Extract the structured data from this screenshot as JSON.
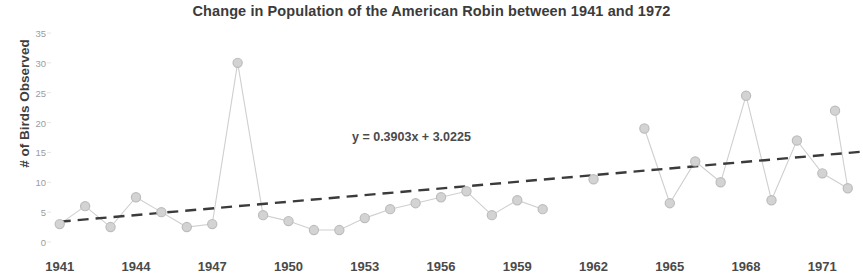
{
  "chart_data": {
    "type": "line",
    "title": "Change in Population of the American Robin between 1941 and 1972",
    "xlabel": "",
    "ylabel": "# of Birds Observed",
    "xlim": [
      1940.5,
      1972.6
    ],
    "ylim": [
      0,
      35
    ],
    "grid": false,
    "legend": false,
    "y_ticks": [
      0,
      5,
      10,
      15,
      20,
      25,
      30,
      35
    ],
    "x_ticks": [
      1941,
      1944,
      1947,
      1950,
      1953,
      1956,
      1959,
      1962,
      1965,
      1968,
      1971
    ],
    "x_tick_labels": [
      "1941",
      "1944",
      "1947",
      "1950",
      "1953",
      "1956",
      "1959",
      "1962",
      "1965",
      "1968",
      "1971"
    ],
    "y_tick_labels": [
      "0",
      "5",
      "10",
      "15",
      "20",
      "25",
      "30",
      "35"
    ],
    "annotations": [
      {
        "text": "y = 0.3903x + 3.0225",
        "x": 1954.2,
        "y": 17.2
      }
    ],
    "series": [
      {
        "name": "# of Birds Observed",
        "type": "line",
        "marker": "circle",
        "color": "#c9c9c9",
        "line_color": "#cfcfcf",
        "x": [
          1941,
          1942,
          1943,
          1944,
          1945,
          1946,
          1947,
          1948,
          1949,
          1950,
          1951,
          1952,
          1953,
          1954,
          1955,
          1956,
          1957,
          1958,
          1959,
          1960,
          1962,
          1964,
          1965,
          1966,
          1967,
          1968,
          1969,
          1970,
          1971,
          1972
        ],
        "values": [
          3,
          6,
          2.5,
          7.5,
          5,
          2.5,
          3,
          30,
          4.5,
          3.5,
          2,
          2,
          4,
          5.5,
          6.5,
          7.5,
          8.5,
          4.5,
          7,
          5.5,
          10.5,
          19,
          6.5,
          13.5,
          10,
          24.5,
          7,
          17,
          11.5,
          9
        ],
        "gaps": [
          [
            1960,
            1962
          ],
          [
            1962,
            1964
          ]
        ]
      },
      {
        "name": "Linear trendline",
        "type": "line",
        "style": "dashed",
        "color": "#3b3b3b",
        "equation": "y = 0.3903x + 3.0225",
        "slope": 0.3903,
        "intercept": 3.0225,
        "endpoints": [
          {
            "x": 1941,
            "y": 3.4
          },
          {
            "x": 1972.5,
            "y": 15.1
          }
        ]
      }
    ],
    "points_connected_right_edge": [
      {
        "x": 1971.5,
        "y": 22
      }
    ]
  },
  "colors": {
    "title": "#3b3b3b",
    "axis_label": "#4a4a4a",
    "tick_label_y": "#9c9c9c",
    "marker_fill": "#d3d3d3",
    "marker_stroke": "#bdbdbd",
    "series_line": "#cfcfcf",
    "trendline": "#3b3b3b",
    "background": "#ffffff"
  }
}
